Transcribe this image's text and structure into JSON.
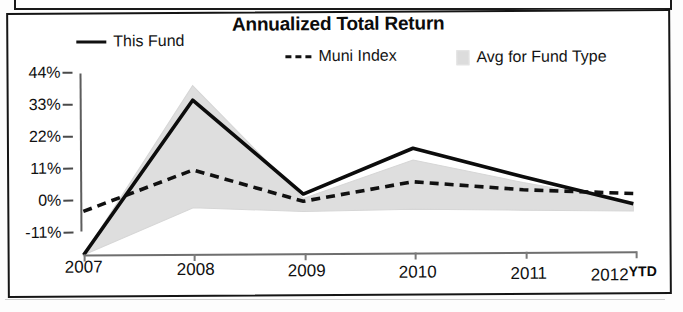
{
  "header": {
    "title": "Annualized Total Return"
  },
  "legend": [
    {
      "label": "This Fund",
      "style": "solid-line",
      "swatch": "solid-line-swatch",
      "color": "#111111"
    },
    {
      "label": "Muni Index",
      "style": "dashed-line",
      "swatch": "dashed-line-swatch",
      "color": "#111111"
    },
    {
      "label": "Avg for Fund Type",
      "style": "filled-band",
      "swatch": "shaded-box-swatch",
      "color": "#dcdcdc"
    }
  ],
  "axes": {
    "y_ticks": [
      "44%",
      "33%",
      "22%",
      "11%",
      "0%",
      "-11%"
    ],
    "x_ticks": [
      "2007",
      "2008",
      "2009",
      "2010",
      "2011",
      "2012"
    ],
    "x_suffix": "YTD"
  },
  "chart_data": {
    "type": "line",
    "title": "Annualized Total Return",
    "xlabel": "",
    "ylabel": "",
    "categories": [
      "2007",
      "2008",
      "2009",
      "2010",
      "2011",
      "2012"
    ],
    "x_tick_labels": [
      "2007",
      "2008",
      "2009",
      "2010",
      "2011",
      "2012"
    ],
    "y_tick_labels": [
      "44%",
      "33%",
      "22%",
      "11%",
      "0%",
      "-11%"
    ],
    "y_tick_values": [
      44,
      33,
      22,
      11,
      0,
      -11
    ],
    "ylim": [
      -18,
      44
    ],
    "grid": false,
    "legend_position": "top",
    "units": "percent",
    "series": [
      {
        "name": "This Fund",
        "style": "solid",
        "color": "#111111",
        "values": [
          -17.0,
          36.0,
          3.5,
          19.0,
          9.0,
          -0.5
        ]
      },
      {
        "name": "Muni Index",
        "style": "dashed",
        "color": "#111111",
        "values": [
          -2.0,
          12.0,
          1.0,
          7.5,
          4.5,
          3.0
        ]
      },
      {
        "name": "Avg for Fund Type",
        "style": "band",
        "color": "#dcdcdc",
        "band_upper": [
          -17.0,
          41.0,
          2.0,
          15.0,
          7.0,
          0.0
        ],
        "band_lower": [
          -17.0,
          -1.0,
          -2.5,
          -2.0,
          -2.5,
          -3.0
        ]
      }
    ],
    "annotations": [
      "YTD"
    ]
  }
}
